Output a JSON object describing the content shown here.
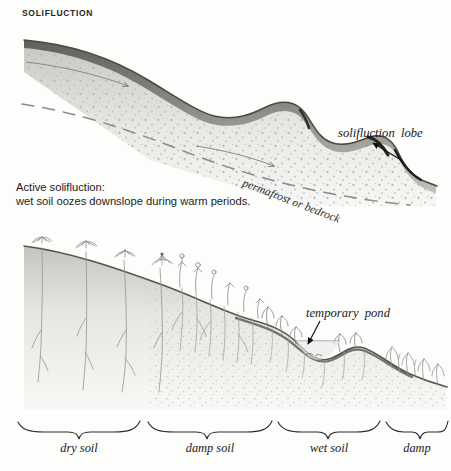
{
  "figure": {
    "title": "SOLIFLUCTION",
    "background_color": "#fdfdfc",
    "ink_color": "#1a1a1a",
    "width": 451,
    "height": 471
  },
  "upper_panel": {
    "caption_line1": "Active solifluction:",
    "caption_line2": "wet soil oozes downslope during warm periods.",
    "lobe_label": "solifluction  lobe",
    "substrate_label": "permafrost or bedrock",
    "flow_arrows": 2,
    "lobes": 3,
    "stipple_color": "#b9b9b9",
    "surface_color": "#55544f",
    "dash_color": "#7a7a7a"
  },
  "lower_panel": {
    "pond_label": "temporary  pond",
    "water_color": "#8e9296",
    "root_color": "#8f8f8f",
    "soil_color": "#6f6e68"
  },
  "zones": [
    {
      "label": "dry soil",
      "start": 18,
      "end": 140
    },
    {
      "label": "damp soil",
      "start": 148,
      "end": 272
    },
    {
      "label": "wet soil",
      "start": 278,
      "end": 380
    },
    {
      "label": "damp",
      "start": 386,
      "end": 448
    }
  ]
}
